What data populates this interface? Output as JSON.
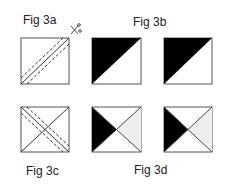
{
  "labels": {
    "fig3a": "Fig 3a",
    "fig3b": "Fig 3b",
    "fig3c": "Fig 3c",
    "fig3d": "Fig 3d"
  },
  "colors": {
    "line": "#555555",
    "fill_dark": "#000000",
    "fill_light": "#eeeeee",
    "background": "#ffffff"
  },
  "icons": {
    "scissors": "scissors-icon"
  }
}
